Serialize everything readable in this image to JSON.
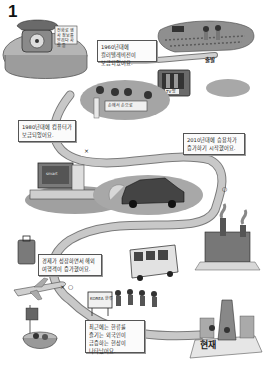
{
  "figure": {
    "number": "1",
    "type": "illustrated-timeline",
    "colors": {
      "ink": "#222222",
      "road": "#c8c8c8",
      "road_edge": "#7a7a7a",
      "ground": "#9a9a9a",
      "caption_bg": "#fbfbfb"
    }
  },
  "labels": {
    "start": "출발",
    "now": "현재",
    "phone_note": "전화로 행사 정보를 알리다 사람 들",
    "banner": "손에서 손으로",
    "tv_label": "TV 방",
    "computer_label": "smart",
    "kpop_sign": "KOREA 한류",
    "road_marker_x": "×",
    "road_marker_o": "○"
  },
  "captions": [
    {
      "id": "1960s",
      "text": "1960년대에 컬러텔레비전이 보급되었어요."
    },
    {
      "id": "1980s",
      "text": "1980년대에 컴퓨터가 보급되었어요."
    },
    {
      "id": "2010s",
      "text": "2010년대에 승용차가 증가하기 시작했어요."
    },
    {
      "id": "economy",
      "text": "경제가 성장하면서 해외 여행객이 증가했어요."
    },
    {
      "id": "hallyu",
      "text": "최근에는 한류를 즐기는 외국인이 급증하는 현상이 나타났어요."
    }
  ],
  "scenes": [
    {
      "name": "rotary-telephone"
    },
    {
      "name": "farm-field-with-cow"
    },
    {
      "name": "television-set"
    },
    {
      "name": "people-with-banner"
    },
    {
      "name": "desktop-computer"
    },
    {
      "name": "car-with-exhaust"
    },
    {
      "name": "factory-chimneys"
    },
    {
      "name": "suitcase"
    },
    {
      "name": "airplane"
    },
    {
      "name": "food-bowl-with-flag"
    },
    {
      "name": "bus"
    },
    {
      "name": "dancing-group"
    },
    {
      "name": "modern-city-tower"
    }
  ]
}
